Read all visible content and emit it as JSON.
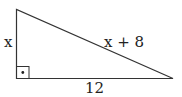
{
  "diagram": {
    "type": "right-triangle",
    "labels": {
      "left_side": "x",
      "hypotenuse": "x + 8",
      "base": "12"
    },
    "right_angle_marker": "dot-in-square",
    "colors": {
      "stroke": "#333333",
      "background": "#ffffff",
      "text": "#222222"
    }
  }
}
